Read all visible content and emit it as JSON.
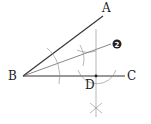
{
  "diagram": {
    "points": {
      "A": {
        "label": "A",
        "x": 103,
        "y": 16
      },
      "B": {
        "label": "B",
        "x": 23,
        "y": 76
      },
      "C": {
        "label": "C",
        "x": 125,
        "y": 76
      },
      "D": {
        "label": "D",
        "x": 96,
        "y": 76
      }
    },
    "marker": {
      "label": "2",
      "symbol": "②",
      "x": 117,
      "y": 44
    },
    "colors": {
      "line": "#333333",
      "construction": "#888888",
      "marker_fill": "#222222",
      "marker_text": "#ffffff"
    }
  }
}
